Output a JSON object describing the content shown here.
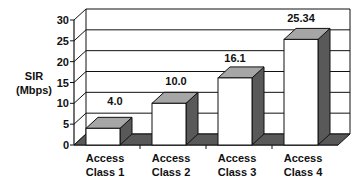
{
  "chart_data": {
    "type": "bar",
    "title": "",
    "xlabel": "",
    "ylabel": "SIR (Mbps)",
    "ylabel_lines": [
      "SIR",
      "(Mbps)"
    ],
    "categories": [
      "Access Class 1",
      "Access Class 2",
      "Access Class 3",
      "Access Class 4"
    ],
    "category_lines": [
      [
        "Access",
        "Class 1"
      ],
      [
        "Access",
        "Class 2"
      ],
      [
        "Access",
        "Class 3"
      ],
      [
        "Access",
        "Class 4"
      ]
    ],
    "values": [
      4.0,
      10.0,
      16.1,
      25.34
    ],
    "data_labels": [
      "4.0",
      "10.0",
      "16.1",
      "25.34"
    ],
    "ylim": [
      0,
      30
    ],
    "yticks": [
      0,
      5,
      10,
      15,
      20,
      25,
      30
    ],
    "grid": true,
    "style": "3d",
    "colors": {
      "bar_front": "#ffffff",
      "bar_top": "#a6a6a6",
      "bar_side": "#595959",
      "floor": "#595959",
      "line": "#111111"
    }
  }
}
